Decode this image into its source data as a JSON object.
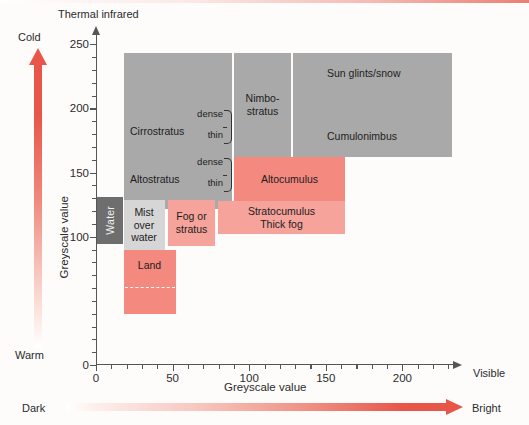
{
  "figure": {
    "top_label": "Thermal infrared",
    "right_axis_end_label": "Visible",
    "x_axis_title": "Greyscale value",
    "y_axis_title": "Greyscale value",
    "temperature_scale": {
      "top": "Cold",
      "bottom": "Warm"
    },
    "brightness_scale": {
      "left": "Dark",
      "right": "Bright"
    }
  },
  "axes": {
    "x": {
      "min": 0,
      "max": 235,
      "labeled_ticks": [
        0,
        50,
        100,
        150,
        200
      ],
      "minor_tick_step": 10
    },
    "y": {
      "min": 0,
      "max": 258,
      "labeled_ticks": [
        0,
        100,
        150,
        200,
        250
      ],
      "minor_tick_step": 10
    }
  },
  "chart_data": {
    "type": "scatter",
    "xlabel": "Greyscale value",
    "ylabel": "Greyscale value",
    "xlim": [
      0,
      235
    ],
    "ylim": [
      0,
      258
    ],
    "grid": false,
    "regions": [
      {
        "label": "Cirrostratus",
        "color": "#a9a9a9",
        "tone": "grey",
        "x0": 18,
        "x1": 89,
        "y0": 153,
        "y1": 255
      },
      {
        "label": "Altostratus",
        "color": "#a9a9a9",
        "tone": "grey",
        "x0": 18,
        "x1": 89,
        "y0": 153,
        "y1": 190
      },
      {
        "label": "Nimbo-stratus",
        "color": "#a9a9a9",
        "tone": "grey",
        "x0": 92,
        "x1": 127,
        "y0": 181,
        "y1": 255
      },
      {
        "label": "Sun glints/snow",
        "color": "#a9a9a9",
        "tone": "grey",
        "x0": 130,
        "x1": 233,
        "y0": 181,
        "y1": 255
      },
      {
        "label": "Cumulonimbus",
        "color": "#a9a9a9",
        "tone": "grey",
        "x0": 130,
        "x1": 233,
        "y0": 181,
        "y1": 255
      },
      {
        "label": "Altocumulus",
        "color": "#f4897f",
        "tone": "pink",
        "x0": 92,
        "x1": 163,
        "y0": 155,
        "y1": 184
      },
      {
        "label": "Stratocumulus Thick fog",
        "color": "#f5a39b",
        "tone": "pink-light",
        "x0": 80,
        "x1": 163,
        "y0": 134,
        "y1": 155
      },
      {
        "label": "Fog or stratus",
        "color": "#f5a39b",
        "tone": "pink-light",
        "x0": 47,
        "x1": 78,
        "y0": 125,
        "y1": 155
      },
      {
        "label": "Mist over water",
        "color": "#d6d6d6",
        "tone": "grey-light",
        "x0": 18,
        "x1": 45,
        "y0": 122,
        "y1": 155
      },
      {
        "label": "Water",
        "color": "#6e6e6e",
        "tone": "grey-dark",
        "x0": 0,
        "x1": 18,
        "y0": 122,
        "y1": 153
      },
      {
        "label": "Land",
        "color": "#f4897f",
        "tone": "pink",
        "x0": 18,
        "x1": 52,
        "y0": 80,
        "y1": 122
      }
    ],
    "annotations": [
      {
        "label": "dense",
        "attached_to": "Cirrostratus"
      },
      {
        "label": "thin",
        "attached_to": "Cirrostratus"
      },
      {
        "label": "dense",
        "attached_to": "Altostratus"
      },
      {
        "label": "thin",
        "attached_to": "Altostratus"
      },
      {
        "label": "land-subdivision-dashed-line",
        "attached_to": "Land",
        "y": 100
      }
    ]
  },
  "box_labels": {
    "cirrostratus": "Cirrostratus",
    "altostratus": "Altostratus",
    "nimbostratus_line1": "Nimbo-",
    "nimbostratus_line2": "stratus",
    "sun_glints": "Sun glints/snow",
    "cumulonimbus": "Cumulonimbus",
    "altocumulus": "Altocumulus",
    "stratocumulus_line1": "Stratocumulus",
    "stratocumulus_line2": "Thick fog",
    "fog_line1": "Fog or",
    "fog_line2": "stratus",
    "mist_line1": "Mist",
    "mist_line2": "over",
    "mist_line3": "water",
    "water": "Water",
    "land": "Land",
    "dense": "dense",
    "thin": "thin"
  },
  "tick_labels": {
    "y": [
      "250",
      "200",
      "150",
      "100",
      "0"
    ],
    "x": [
      "0",
      "50",
      "100",
      "150",
      "200"
    ]
  }
}
